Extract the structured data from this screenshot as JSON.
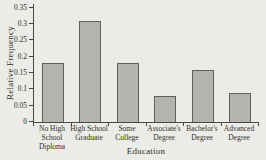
{
  "chart_data": {
    "type": "bar",
    "xlabel": "Education",
    "ylabel": "Relative Frequency",
    "categories": [
      "No High\nSchool\nDiploma",
      "High School\nGraduate",
      "Some\nCollege",
      "Associate's\nDegree",
      "Bachelor's\nDegree",
      "Advanced\nDegree"
    ],
    "values": [
      0.18,
      0.31,
      0.18,
      0.08,
      0.16,
      0.09
    ],
    "ylim": [
      0,
      0.35
    ],
    "yticks": [
      "0",
      "0.05",
      "0.1",
      "0.15",
      "0.2",
      "0.25",
      "0.3",
      "0.35"
    ],
    "grid": false,
    "legend": "none",
    "colors": {
      "background": "#ebebe7",
      "bar_fill": "#b3b4b0",
      "bar_border": "#61615c",
      "axis": "#4a483f",
      "text": "#33312a"
    }
  }
}
